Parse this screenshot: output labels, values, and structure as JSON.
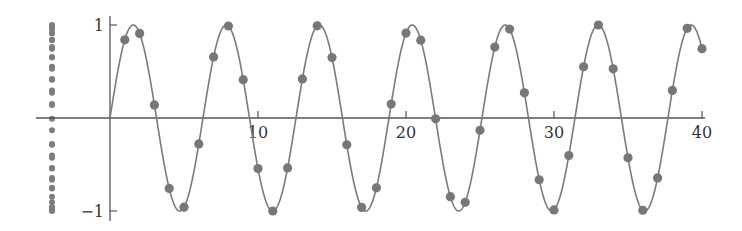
{
  "chart_data": {
    "type": "scatter",
    "title": "",
    "xlabel": "",
    "ylabel": "",
    "function": "sin(x)",
    "xlim": [
      0,
      40
    ],
    "ylim": [
      -1,
      1
    ],
    "grid": false,
    "legend": null,
    "x_ticks": [
      10,
      20,
      30,
      40
    ],
    "x_tick_labels": [
      "10",
      "20",
      "30",
      "40"
    ],
    "y_ticks": [
      1,
      -1
    ],
    "y_tick_labels": [
      "1",
      "−1"
    ],
    "series": [
      {
        "name": "sin(x) curve",
        "kind": "line",
        "x_range": [
          0,
          40
        ]
      },
      {
        "name": "samples sin(n)",
        "kind": "scatter",
        "x": [
          1,
          2,
          3,
          4,
          5,
          6,
          7,
          8,
          9,
          10,
          11,
          12,
          13,
          14,
          15,
          16,
          17,
          18,
          19,
          20,
          21,
          22,
          23,
          24,
          25,
          26,
          27,
          28,
          29,
          30,
          31,
          32,
          33,
          34,
          35,
          36,
          37,
          38,
          39,
          40
        ],
        "values": [
          0.841,
          0.909,
          0.141,
          -0.757,
          -0.959,
          -0.279,
          0.657,
          0.989,
          0.412,
          -0.544,
          -1.0,
          -0.537,
          0.42,
          0.991,
          0.65,
          -0.288,
          -0.961,
          -0.751,
          0.15,
          0.913,
          0.837,
          -0.009,
          -0.846,
          -0.906,
          -0.132,
          0.763,
          0.956,
          0.271,
          -0.664,
          -0.988,
          -0.404,
          0.551,
          1.0,
          0.529,
          -0.428,
          -0.992,
          -0.644,
          0.296,
          0.964,
          0.745
        ]
      },
      {
        "name": "projection onto y-axis",
        "kind": "strip",
        "source": "samples sin(n)"
      }
    ],
    "colors": {
      "axis": "#555555",
      "curve": "#7a7a7a",
      "points": "#777777"
    }
  }
}
